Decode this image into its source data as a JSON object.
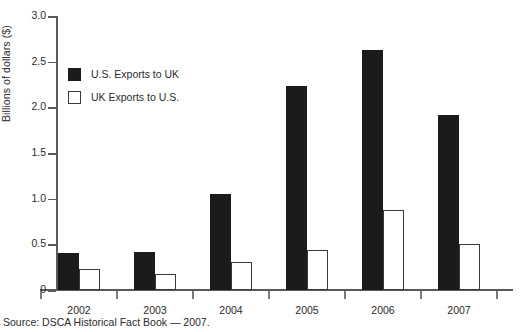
{
  "chart_data": {
    "type": "bar",
    "title": "",
    "xlabel": "",
    "ylabel": "Billions of dollars ($)",
    "categories": [
      "2002",
      "2003",
      "2004",
      "2005",
      "2006",
      "2007"
    ],
    "series": [
      {
        "name": "U.S. Exports to UK",
        "color": "#1b1b1b",
        "values": [
          0.41,
          0.42,
          1.05,
          2.23,
          2.63,
          1.92
        ]
      },
      {
        "name": "UK Exports to U.S.",
        "color": "#ffffff",
        "values": [
          0.23,
          0.17,
          0.31,
          0.44,
          0.88,
          0.5
        ]
      }
    ],
    "ylim": [
      0,
      3.0
    ],
    "yticks": [
      "0",
      "0.5",
      "1.0",
      "1.5",
      "2.0",
      "2.5",
      "3.0"
    ],
    "ytick_values": [
      0,
      0.5,
      1.0,
      1.5,
      2.0,
      2.5,
      3.0
    ],
    "grid": false,
    "legend_position": "upper-left-inside"
  },
  "legend": {
    "items": [
      {
        "label": "U.S. Exports to UK",
        "swatch": "filled-black-square"
      },
      {
        "label": "UK Exports to U.S.",
        "swatch": "outlined-white-square"
      }
    ]
  },
  "source": {
    "text": "Source: DSCA Historical Fact Book — 2007."
  },
  "colors": {
    "series_dark": "#1b1b1b",
    "series_light": "#ffffff",
    "axis": "#5a5a5a",
    "text": "#2b2b2b",
    "background": "#ffffff"
  }
}
